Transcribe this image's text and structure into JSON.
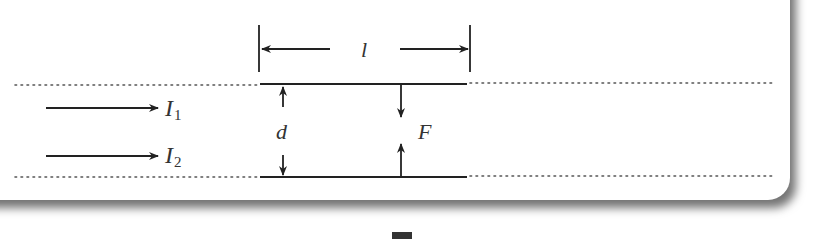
{
  "diagram": {
    "type": "parallel-current-carrying-wires",
    "labels": {
      "length": "l",
      "separation": "d",
      "force": "F",
      "current1": "I",
      "current1_sub": "1",
      "current2": "I",
      "current2_sub": "2"
    },
    "colors": {
      "line": "#222222",
      "dots": "#555555",
      "background": "#ffffff"
    },
    "caption": "图"
  }
}
